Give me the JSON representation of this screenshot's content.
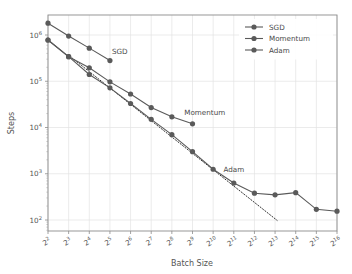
{
  "chart_data": {
    "type": "line",
    "title": "",
    "xlabel": "Batch Size",
    "ylabel": "Steps",
    "xscale": "log2",
    "yscale": "log10",
    "xlim": [
      2,
      16
    ],
    "ylim": [
      100,
      3000000
    ],
    "grid": true,
    "legend_position": "top-right",
    "xticks": [
      {
        "label": "2",
        "sup": "2",
        "value": 2
      },
      {
        "label": "2",
        "sup": "3",
        "value": 3
      },
      {
        "label": "2",
        "sup": "4",
        "value": 4
      },
      {
        "label": "2",
        "sup": "5",
        "value": 5
      },
      {
        "label": "2",
        "sup": "6",
        "value": 6
      },
      {
        "label": "2",
        "sup": "7",
        "value": 7
      },
      {
        "label": "2",
        "sup": "8",
        "value": 8
      },
      {
        "label": "2",
        "sup": "9",
        "value": 9
      },
      {
        "label": "2",
        "sup": "10",
        "value": 10
      },
      {
        "label": "2",
        "sup": "11",
        "value": 11
      },
      {
        "label": "2",
        "sup": "12",
        "value": 12
      },
      {
        "label": "2",
        "sup": "13",
        "value": 13
      },
      {
        "label": "2",
        "sup": "14",
        "value": 14
      },
      {
        "label": "2",
        "sup": "15",
        "value": 15
      },
      {
        "label": "2",
        "sup": "16",
        "value": 16
      }
    ],
    "yticks": [
      {
        "label": "10",
        "sup": "2",
        "value": 100
      },
      {
        "label": "10",
        "sup": "3",
        "value": 1000
      },
      {
        "label": "10",
        "sup": "4",
        "value": 10000
      },
      {
        "label": "10",
        "sup": "5",
        "value": 100000
      },
      {
        "label": "10",
        "sup": "6",
        "value": 1000000
      }
    ],
    "series": [
      {
        "name": "SGD",
        "color": "#5a5a5a",
        "x": [
          2,
          3,
          4,
          5
        ],
        "values": [
          1800000,
          950000,
          520000,
          280000
        ],
        "annotation": {
          "text": "SGD",
          "x": 5.1,
          "y": 430000
        }
      },
      {
        "name": "Momentum",
        "color": "#5a5a5a",
        "x": [
          2,
          3,
          4,
          5,
          6,
          7,
          8,
          9
        ],
        "values": [
          780000,
          340000,
          195000,
          97000,
          53000,
          27000,
          17000,
          12000
        ],
        "annotation": {
          "text": "Momentum",
          "x": 8.6,
          "y": 21000
        }
      },
      {
        "name": "Adam",
        "color": "#5a5a5a",
        "x": [
          2,
          3,
          4,
          5,
          6,
          7,
          8,
          9,
          10,
          11,
          12,
          13,
          14,
          15,
          16
        ],
        "values": [
          780000,
          340000,
          140000,
          72000,
          33000,
          15000,
          7000,
          3000,
          1250,
          630,
          380,
          350,
          390,
          170,
          155
        ],
        "annotation": {
          "text": "Adam",
          "x": 10.5,
          "y": 1250
        }
      }
    ],
    "reference_line": {
      "name": "perfect-scaling",
      "style": "dotted",
      "color": "#333333",
      "x": [
        3.05,
        13.1
      ],
      "values": [
        350000,
        98
      ]
    }
  },
  "legend": {
    "entries": [
      {
        "label": "SGD"
      },
      {
        "label": "Momentum"
      },
      {
        "label": "Adam"
      }
    ]
  }
}
